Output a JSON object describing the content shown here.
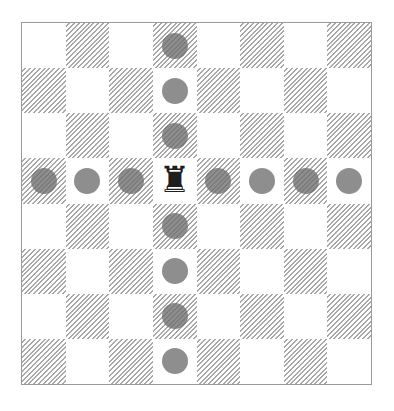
{
  "board": {
    "size": 8,
    "light_color": "#ffffff",
    "dark_pattern": "diagonal-hatch",
    "piece": {
      "type": "rook",
      "color": "black",
      "glyph": "♜",
      "row": 3,
      "col": 3
    },
    "move_markers": [
      {
        "row": 0,
        "col": 3
      },
      {
        "row": 1,
        "col": 3
      },
      {
        "row": 2,
        "col": 3
      },
      {
        "row": 3,
        "col": 0
      },
      {
        "row": 3,
        "col": 1
      },
      {
        "row": 3,
        "col": 2
      },
      {
        "row": 3,
        "col": 4
      },
      {
        "row": 3,
        "col": 5
      },
      {
        "row": 3,
        "col": 6
      },
      {
        "row": 3,
        "col": 7
      },
      {
        "row": 4,
        "col": 3
      },
      {
        "row": 5,
        "col": 3
      },
      {
        "row": 6,
        "col": 3
      },
      {
        "row": 7,
        "col": 3
      }
    ]
  }
}
